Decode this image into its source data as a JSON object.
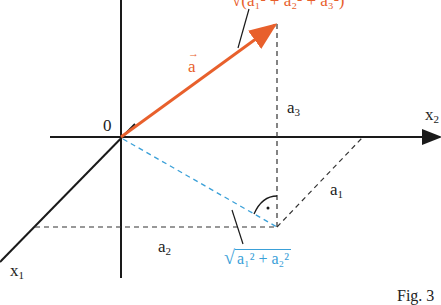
{
  "figure": {
    "caption": "Fig. 3",
    "colors": {
      "vector": "#e8602c",
      "projection": "#3aa0d8",
      "axes": "#1a1a1a",
      "dashed": "#333333"
    },
    "labels": {
      "origin": "0",
      "x1": "x",
      "x1_sub": "1",
      "x2": "x",
      "x2_sub": "2",
      "vector": "a",
      "vector_arrow": "→",
      "a1": "a",
      "a1_sub": "1",
      "a2": "a",
      "a2_sub": "2",
      "a3": "a",
      "a3_sub": "3",
      "length_full": "√(a₁² + a₂² + a₃²)",
      "length_proj_radical": "√",
      "length_proj_text": "a₁² + a₂²",
      "right_angle_dot": "·"
    }
  }
}
